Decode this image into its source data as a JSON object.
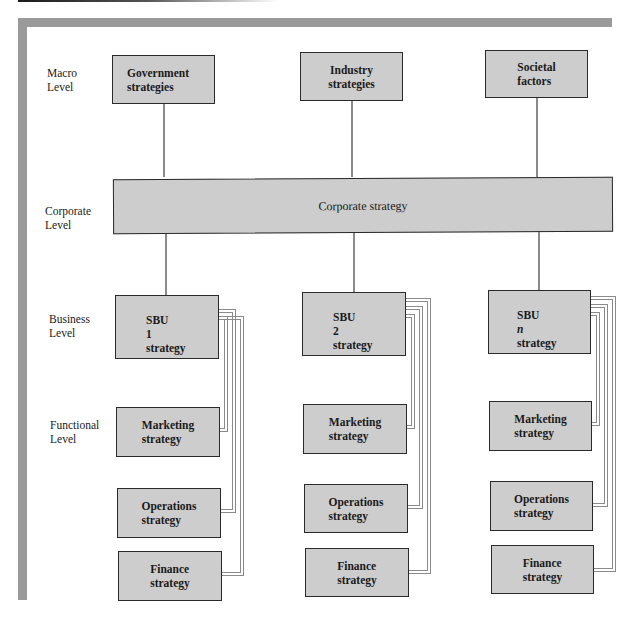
{
  "levels": {
    "macro": [
      "Macro",
      "Level"
    ],
    "corporate": [
      "Corporate",
      "Level"
    ],
    "business": [
      "Business",
      "Level"
    ],
    "functional": [
      "Functional",
      "Level"
    ]
  },
  "macro_boxes": [
    {
      "line1": "Government",
      "line2": "strategies"
    },
    {
      "line1": "Industry",
      "line2": "strategies"
    },
    {
      "line1": "Societal",
      "line2": "factors"
    }
  ],
  "corporate_box": {
    "label": "Corporate strategy"
  },
  "columns": [
    {
      "sbu": {
        "line1_prefix": "SBU ",
        "line1_suffix": "1",
        "italic_suffix": false,
        "line2": "strategy"
      },
      "functional": [
        {
          "line1": "Marketing",
          "line2": "strategy"
        },
        {
          "line1": "Operations",
          "line2": "strategy"
        },
        {
          "line1": "Finance",
          "line2": "strategy"
        }
      ]
    },
    {
      "sbu": {
        "line1_prefix": "SBU ",
        "line1_suffix": "2",
        "italic_suffix": false,
        "line2": "strategy"
      },
      "functional": [
        {
          "line1": "Marketing",
          "line2": "strategy"
        },
        {
          "line1": "Operations",
          "line2": "strategy"
        },
        {
          "line1": "Finance",
          "line2": "strategy"
        }
      ]
    },
    {
      "sbu": {
        "line1_prefix": "SBU ",
        "line1_suffix": "n",
        "italic_suffix": true,
        "line2": "strategy"
      },
      "functional": [
        {
          "line1": "Marketing",
          "line2": "strategy"
        },
        {
          "line1": "Operations",
          "line2": "strategy"
        },
        {
          "line1": "Finance",
          "line2": "strategy"
        }
      ]
    }
  ],
  "colors": {
    "box_fill": "#cdcdcd",
    "box_border": "#2a2a2a",
    "frame": "#9a9a9a",
    "connector": "#8a8a8a"
  }
}
